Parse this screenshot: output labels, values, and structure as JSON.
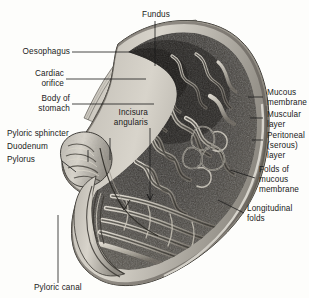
{
  "figure": {
    "background_color": "#fdfdfb",
    "ink_color": "#1a1a1a",
    "style": "halftone anatomical engraving, grayscale"
  },
  "labels": {
    "fundus": "Fundus",
    "oesophagus": "Oesophagus",
    "cardiac_orifice": "Cardiac\norifice",
    "body_of_stomach": "Body of\nstomach",
    "incisura_angularis": "Incisura\nangularis",
    "pyloric_sphincter": "Pyloric sphincter",
    "duodenum": "Duodenum",
    "pylorus": "Pylorus",
    "pyloric_canal": "Pyloric canal",
    "mucous_membrane": "Mucous\nmembrane",
    "muscular_layer": "Muscular\nlayer",
    "peritoneal_layer": "Peritoneal\n(serous)\nlayer",
    "folds_of_mucous_membrane": "Folds of\nmucous\nmembrane",
    "longitudinal_folds": "Longitudinal\nfolds"
  }
}
